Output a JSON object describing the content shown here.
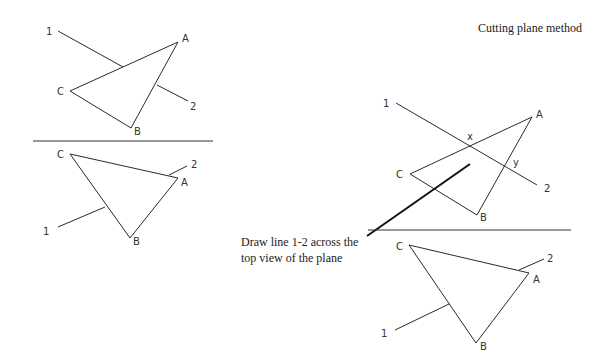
{
  "title": "Cutting plane method",
  "caption": {
    "line1": "Draw line 1-2 across the",
    "line2": "top view of the plane"
  },
  "left_diagram": {
    "top_view": {
      "labels": {
        "A": "A",
        "B": "B",
        "C": "C",
        "p1": "1",
        "p2": "2"
      }
    },
    "front_view": {
      "labels": {
        "A": "A",
        "B": "B",
        "C": "C",
        "p1": "1",
        "p2": "2"
      }
    }
  },
  "right_diagram": {
    "top_view": {
      "labels": {
        "A": "A",
        "B": "B",
        "C": "C",
        "p1": "1",
        "p2": "2",
        "x": "x",
        "y": "y"
      }
    },
    "front_view": {
      "labels": {
        "A": "A",
        "B": "B",
        "C": "C",
        "p1": "1",
        "p2": "2"
      }
    }
  }
}
